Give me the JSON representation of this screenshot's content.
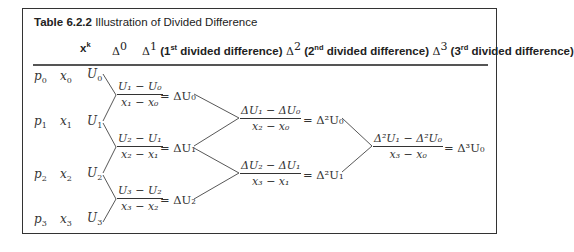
{
  "caption": {
    "label": "Table 6.2.2",
    "title": "Illustration of Divided Difference"
  },
  "header": {
    "xk": "x",
    "xk_sup": "k",
    "d0": "Δ",
    "d0_sup": "0",
    "d1": "Δ",
    "d1_sup": "1",
    "d1_text_a": " (1",
    "d1_ord": "st",
    "d1_text_b": " divided difference)",
    "d2": " Δ",
    "d2_sup": "2",
    "d2_text_a": " (2",
    "d2_ord": "nd",
    "d2_text_b": " divided difference)",
    "d3": " Δ",
    "d3_sup": "3",
    "d3_text_a": " (3",
    "d3_ord": "rd",
    "d3_text_b": " divided difference)"
  },
  "rows": [
    {
      "p": "p",
      "i": "0",
      "x": "x",
      "U": "U"
    },
    {
      "p": "p",
      "i": "1",
      "x": "x",
      "U": "U"
    },
    {
      "p": "p",
      "i": "2",
      "x": "x",
      "U": "U"
    },
    {
      "p": "p",
      "i": "3",
      "x": "x",
      "U": "U"
    }
  ],
  "first_differences": [
    {
      "num": "U₁ − U₀",
      "den": "x₁ − x₀",
      "result": "= ΔU₀"
    },
    {
      "num": "U₂ − U₁",
      "den": "x₂ − x₁",
      "result": "= ΔU₁"
    },
    {
      "num": "U₃ − U₂",
      "den": "x₃ − x₂",
      "result": "= ΔU₂"
    }
  ],
  "second_differences": [
    {
      "num": "ΔU₁ − ΔU₀",
      "den": "x₂ − x₀",
      "result": "= Δ²U₀"
    },
    {
      "num": "ΔU₂ − ΔU₁",
      "den": "x₃ − x₁",
      "result": "= Δ²U₁"
    }
  ],
  "third_differences": [
    {
      "num": "Δ²U₁ − Δ²U₀",
      "den": "x₃ − x₀",
      "result": "= Δ³U₀"
    }
  ]
}
